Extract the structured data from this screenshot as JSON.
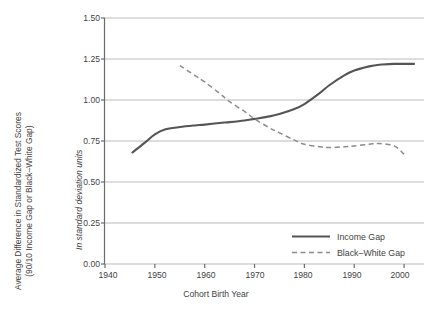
{
  "axes": {
    "y_label_lines": [
      "Average Difference in Standardized Test Scores",
      "(90/10 Income Gap or Black–White Gap)"
    ],
    "y_label_units": "In standard deviation units",
    "x_label": "Cohort Birth Year",
    "y_ticks": [
      "0.00",
      "0.25",
      "0.50",
      "0.75",
      "1.00",
      "1.25",
      "1.50"
    ],
    "x_ticks": [
      "1940",
      "1950",
      "1960",
      "1970",
      "1980",
      "1990",
      "2000"
    ]
  },
  "legend": {
    "income_label": "Income Gap",
    "bw_label": "Black–White Gap"
  },
  "colors": {
    "income_line": "#555555",
    "bw_line": "#8c8c8c",
    "grid": "#aaaaaa",
    "axis": "#6b6b6b",
    "text": "#3f3f3f"
  },
  "chart_data": {
    "type": "line",
    "title": "",
    "xlabel": "Cohort Birth Year",
    "ylabel": "Average Difference in Standardized Test Scores (90/10 Income Gap or Black–White Gap)",
    "ylabel_secondary": "In standard deviation units",
    "xlim": [
      1940,
      2004
    ],
    "ylim": [
      0.0,
      1.5
    ],
    "yticks": [
      0.0,
      0.25,
      0.5,
      0.75,
      1.0,
      1.25,
      1.5
    ],
    "xticks": [
      1940,
      1950,
      1960,
      1970,
      1980,
      1990,
      2000
    ],
    "grid": "horizontal",
    "legend_position": "bottom-right",
    "series": [
      {
        "name": "Income Gap",
        "style": "solid",
        "color": "#555555",
        "x": [
          1945.5,
          1948,
          1950,
          1952,
          1955,
          1958,
          1960,
          1963,
          1965,
          1968,
          1970,
          1973,
          1975,
          1978,
          1980,
          1983,
          1985,
          1988,
          1990,
          1993,
          1995,
          1998,
          2000,
          2002
        ],
        "y": [
          0.68,
          0.74,
          0.79,
          0.82,
          0.835,
          0.845,
          0.85,
          0.86,
          0.865,
          0.875,
          0.885,
          0.9,
          0.915,
          0.945,
          0.975,
          1.04,
          1.09,
          1.15,
          1.18,
          1.205,
          1.215,
          1.22,
          1.22,
          1.22
        ]
      },
      {
        "name": "Black–White Gap",
        "style": "dashed",
        "color": "#8c8c8c",
        "x": [
          1955,
          1958,
          1960,
          1963,
          1965,
          1968,
          1970,
          1973,
          1975,
          1978,
          1980,
          1983,
          1985,
          1988,
          1990,
          1993,
          1995,
          1998,
          2000
        ],
        "y": [
          1.21,
          1.15,
          1.11,
          1.04,
          0.99,
          0.93,
          0.885,
          0.83,
          0.8,
          0.755,
          0.73,
          0.715,
          0.71,
          0.715,
          0.72,
          0.73,
          0.735,
          0.72,
          0.67
        ]
      }
    ],
    "annotations": {
      "crossover_year": 1970,
      "crossover_value": 0.885
    }
  }
}
